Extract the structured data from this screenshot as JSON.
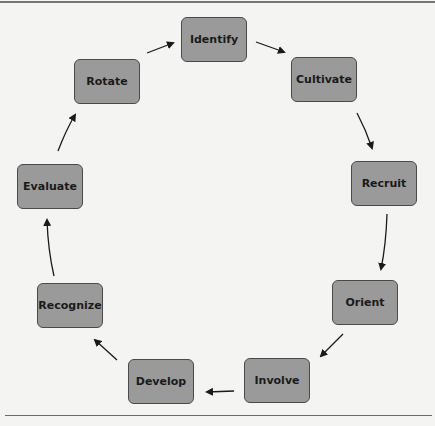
{
  "diagram": {
    "type": "cycle",
    "nodes": [
      {
        "id": "identify",
        "label": "Identify",
        "x": 181,
        "y": 17
      },
      {
        "id": "cultivate",
        "label": "Cultivate",
        "x": 291,
        "y": 57
      },
      {
        "id": "recruit",
        "label": "Recruit",
        "x": 351,
        "y": 161
      },
      {
        "id": "orient",
        "label": "Orient",
        "x": 332,
        "y": 280
      },
      {
        "id": "involve",
        "label": "Involve",
        "x": 244,
        "y": 358
      },
      {
        "id": "develop",
        "label": "Develop",
        "x": 128,
        "y": 359
      },
      {
        "id": "recognize",
        "label": "Recognize",
        "x": 37,
        "y": 283
      },
      {
        "id": "evaluate",
        "label": "Evaluate",
        "x": 17,
        "y": 164
      },
      {
        "id": "rotate",
        "label": "Rotate",
        "x": 74,
        "y": 59
      }
    ],
    "edges": [
      [
        "identify",
        "cultivate"
      ],
      [
        "cultivate",
        "recruit"
      ],
      [
        "recruit",
        "orient"
      ],
      [
        "orient",
        "involve"
      ],
      [
        "involve",
        "develop"
      ],
      [
        "develop",
        "recognize"
      ],
      [
        "recognize",
        "evaluate"
      ],
      [
        "evaluate",
        "rotate"
      ],
      [
        "rotate",
        "identify"
      ]
    ],
    "colors": {
      "node_fill": "#9a9a9a",
      "node_border": "#4a4a4a",
      "text": "#1a1a1a",
      "arrow": "#1a1a1a",
      "background": "#f4f4f2"
    }
  }
}
